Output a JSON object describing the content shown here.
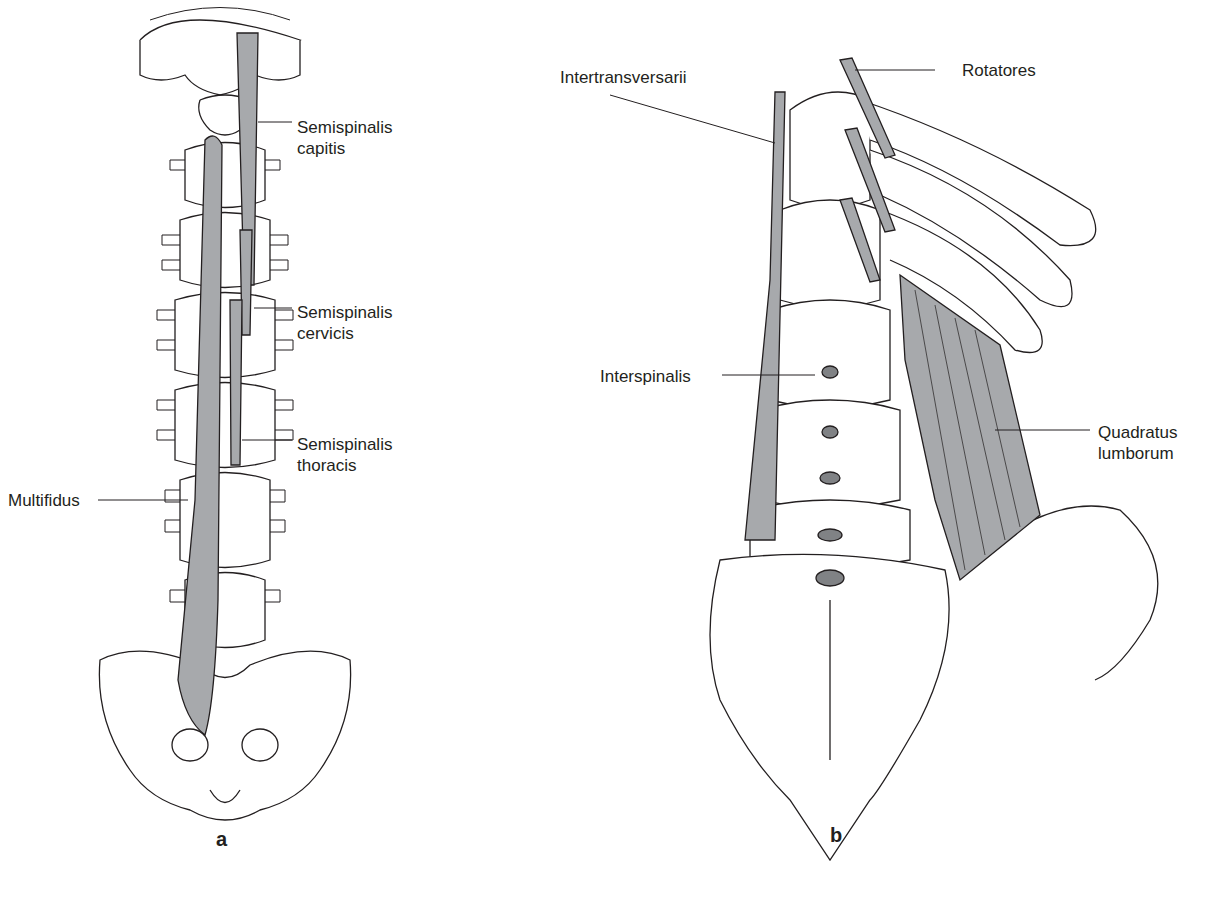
{
  "figure": {
    "panels": [
      {
        "id": "a",
        "label": "a",
        "annotations": [
          {
            "text_line1": "Semispinalis",
            "text_line2": "capitis"
          },
          {
            "text_line1": "Semispinalis",
            "text_line2": "cervicis"
          },
          {
            "text_line1": "Semispinalis",
            "text_line2": "thoracis"
          },
          {
            "text_line1": "Multifidus"
          }
        ]
      },
      {
        "id": "b",
        "label": "b",
        "annotations": [
          {
            "text_line1": "Intertransversarii"
          },
          {
            "text_line1": "Rotatores"
          },
          {
            "text_line1": "Interspinalis"
          },
          {
            "text_line1": "Quadratus",
            "text_line2": "lumborum"
          }
        ]
      }
    ],
    "colors": {
      "outline": "#231f20",
      "muscle": "#a7a9ac",
      "muscle_dark": "#808285",
      "bone_shadow": "#e6e7e8"
    }
  }
}
